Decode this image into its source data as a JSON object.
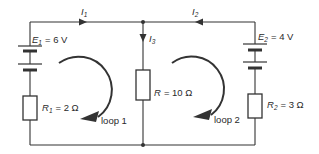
{
  "diagram": {
    "type": "circuit",
    "colors": {
      "line": "#333333",
      "background": "#ffffff"
    },
    "currents": {
      "I1": {
        "symbol": "I",
        "sub": "1"
      },
      "I2": {
        "symbol": "I",
        "sub": "2"
      },
      "I3": {
        "symbol": "I",
        "sub": "3"
      }
    },
    "sources": {
      "E1": {
        "symbol": "E",
        "sub": "1",
        "value": "= 6 V"
      },
      "E2": {
        "symbol": "E",
        "sub": "2",
        "value": "= 4 V"
      }
    },
    "resistors": {
      "R1": {
        "symbol": "R",
        "sub": "1",
        "value": "= 2 Ω"
      },
      "R": {
        "symbol": "R",
        "sub": "",
        "value": "= 10 Ω"
      },
      "R2": {
        "symbol": "R",
        "sub": "2",
        "value": "= 3 Ω"
      }
    },
    "loops": {
      "loop1": {
        "label": "loop 1"
      },
      "loop2": {
        "label": "loop 2"
      }
    }
  }
}
